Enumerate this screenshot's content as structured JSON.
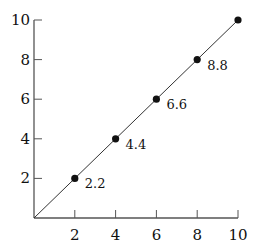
{
  "chart_data": {
    "type": "scatter",
    "title": "",
    "xlabel": "",
    "ylabel": "",
    "xlim": [
      0,
      10
    ],
    "ylim": [
      0,
      10
    ],
    "grid": false,
    "legend": null,
    "x_ticks": [
      2,
      4,
      6,
      8,
      10
    ],
    "y_ticks": [
      2,
      4,
      6,
      8,
      10
    ],
    "series": [
      {
        "name": "points",
        "x": [
          2,
          4,
          6,
          8,
          10
        ],
        "y": [
          2,
          4,
          6,
          8,
          10
        ],
        "marker": "filled-circle",
        "line": "solid",
        "color": "#111111"
      }
    ],
    "line_from_origin": true,
    "annotations": [
      {
        "x": 2,
        "y": 2,
        "text": "2.2"
      },
      {
        "x": 4,
        "y": 4,
        "text": "4.4"
      },
      {
        "x": 6,
        "y": 6,
        "text": "6.6"
      },
      {
        "x": 8,
        "y": 8,
        "text": "8.8"
      }
    ]
  }
}
